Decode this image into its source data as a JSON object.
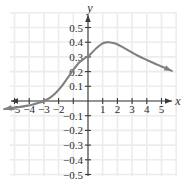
{
  "chart_data": {
    "type": "line",
    "title": "",
    "xlabel": "x",
    "ylabel": "y",
    "grid": true,
    "legend": null,
    "xlim": [
      -5.8,
      5.8
    ],
    "ylim": [
      -0.58,
      0.58
    ],
    "x_ticks": [
      -5,
      -4,
      -3,
      -2,
      -1,
      1,
      2,
      3,
      4,
      5
    ],
    "x_tick_labels": [
      "−5",
      "−4",
      "−3",
      "−2",
      "",
      "1",
      "2",
      "3",
      "4",
      "5"
    ],
    "y_ticks": [
      0.5,
      0.4,
      0.3,
      0.2,
      0.1,
      -0.1,
      -0.2,
      -0.3,
      -0.4,
      -0.5
    ],
    "y_tick_labels": [
      "0.5",
      "0.4",
      "0.3",
      "0.2",
      "0.1",
      "−0.1",
      "−0.2",
      "−0.3",
      "−0.4",
      "−0.5"
    ],
    "grid_step_x": 1,
    "grid_step_y": 0.1,
    "series": [
      {
        "name": "curve",
        "color": "#808080",
        "arrow_start": true,
        "arrow_end": true,
        "x": [
          -5.7,
          -5.4,
          -5.0,
          -4.6,
          -4.2,
          -3.8,
          -3.4,
          -3.0,
          -2.6,
          -2.2,
          -1.8,
          -1.4,
          -1.0,
          -0.6,
          -0.2,
          0.0,
          0.2,
          0.6,
          1.0,
          1.2,
          1.4,
          1.8,
          2.2,
          2.6,
          3.0,
          3.4,
          3.8,
          4.2,
          4.6,
          5.0,
          5.4,
          5.7
        ],
        "y": [
          -0.055,
          -0.05,
          -0.045,
          -0.04,
          -0.033,
          -0.025,
          -0.014,
          0.0,
          0.022,
          0.055,
          0.1,
          0.155,
          0.212,
          0.262,
          0.293,
          0.303,
          0.322,
          0.362,
          0.392,
          0.398,
          0.4,
          0.393,
          0.375,
          0.353,
          0.33,
          0.308,
          0.288,
          0.27,
          0.252,
          0.235,
          0.218,
          0.205
        ]
      }
    ],
    "colors": {
      "curve": "#808080",
      "axis": "#3a3a3a",
      "grid": "#ececec",
      "tick_label": "#2b2b2b",
      "background": "#ffffff"
    }
  }
}
